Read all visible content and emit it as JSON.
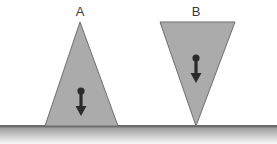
{
  "figure": {
    "background_color": "#ffffff",
    "width": 277,
    "height": 144
  },
  "ground": {
    "name": "ground-surface",
    "line_y": 126,
    "line_color": "#6b6b6b",
    "line_thickness": 2,
    "gradient_top_color": "#9a9a9a",
    "gradient_bottom_color": "#ffffff",
    "gradient_height": 18,
    "x_start": 0,
    "x_end": 277
  },
  "shapes": [
    {
      "id": "A",
      "label": "A",
      "orientation": "upright",
      "description": "Upright triangle resting on its base",
      "fill_color": "#ababab",
      "stroke_color": "#6e6e6e",
      "stroke_width": 1,
      "points": "80,22 118,126 45,126",
      "label_x": 80,
      "label_y": 16,
      "arrow": {
        "name": "weight-arrow-a",
        "direction": "down",
        "color": "#2b2b2b",
        "dot_cx": 81,
        "dot_cy": 91,
        "dot_r": 3.6,
        "shaft_x": 81,
        "shaft_y1": 91,
        "shaft_y2": 110,
        "shaft_width": 3.2,
        "head_points": "81,116 75.5,106 86.5,106"
      }
    },
    {
      "id": "B",
      "label": "B",
      "orientation": "inverted",
      "description": "Inverted triangle balanced on its apex",
      "fill_color": "#ababab",
      "stroke_color": "#6e6e6e",
      "stroke_width": 1,
      "points": "160,22 235,22 196,126",
      "label_x": 196,
      "label_y": 16,
      "arrow": {
        "name": "weight-arrow-b",
        "direction": "down",
        "color": "#2b2b2b",
        "dot_cx": 196,
        "dot_cy": 58,
        "dot_r": 3.6,
        "shaft_x": 196,
        "shaft_y1": 58,
        "shaft_y2": 77,
        "shaft_width": 3.2,
        "head_points": "196,83 190.5,73 201.5,73"
      }
    }
  ]
}
